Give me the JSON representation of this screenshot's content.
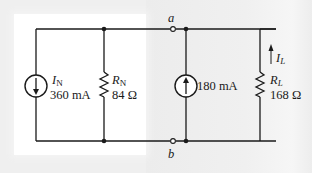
{
  "diagram": {
    "type": "circuit",
    "title": "",
    "terminals": {
      "top": "a",
      "bottom": "b"
    },
    "norton_source": {
      "symbol": "I",
      "subscript": "N",
      "value": "360 mA",
      "direction": "down"
    },
    "norton_resistor": {
      "symbol": "R",
      "subscript": "N",
      "value": "84 Ω"
    },
    "added_source": {
      "value": "180 mA",
      "direction": "up"
    },
    "load_resistor": {
      "symbol": "R",
      "subscript": "L",
      "value": "168 Ω"
    },
    "load_current": {
      "symbol": "I",
      "subscript": "L",
      "direction": "up"
    },
    "colors": {
      "wire": "#1a1a1a",
      "panel": "#ffffff",
      "background": "#efefef"
    }
  }
}
